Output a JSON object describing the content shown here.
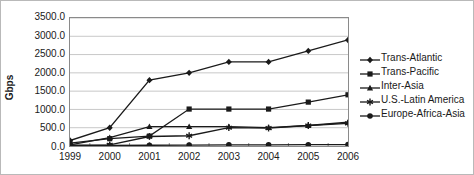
{
  "chart_data": {
    "type": "line",
    "title": "",
    "xlabel": "",
    "ylabel": "Gbps",
    "categories": [
      "1999",
      "2000",
      "2001",
      "2002",
      "2003",
      "2004",
      "2005",
      "2006"
    ],
    "ylim": [
      0,
      3500
    ],
    "yticks": [
      "0.0",
      "500.0",
      "1000.0",
      "1500.0",
      "2000.0",
      "2500.0",
      "3000.0",
      "3500.0"
    ],
    "ytick_values": [
      0,
      500,
      1000,
      1500,
      2000,
      2500,
      3000,
      3500
    ],
    "grid": true,
    "legend_position": "right",
    "series": [
      {
        "name": "Trans-Atlantic",
        "marker": "diamond",
        "color": "#1a1a1a",
        "values": [
          150,
          500,
          1800,
          2000,
          2300,
          2300,
          2600,
          2900
        ]
      },
      {
        "name": "Trans-Pacific",
        "marker": "square",
        "color": "#1a1a1a",
        "values": [
          80,
          200,
          270,
          1010,
          1010,
          1010,
          1200,
          1400
        ]
      },
      {
        "name": "Inter-Asia",
        "marker": "triangle",
        "color": "#1a1a1a",
        "values": [
          30,
          230,
          530,
          530,
          530,
          500,
          560,
          650
        ]
      },
      {
        "name": "U.S.-Latin America",
        "marker": "asterisk",
        "color": "#1a1a1a",
        "values": [
          20,
          30,
          260,
          280,
          500,
          490,
          560,
          620
        ]
      },
      {
        "name": "Europe-Africa-Asia",
        "marker": "circle",
        "color": "#1a1a1a",
        "values": [
          10,
          15,
          20,
          25,
          30,
          32,
          35,
          40
        ]
      }
    ]
  }
}
